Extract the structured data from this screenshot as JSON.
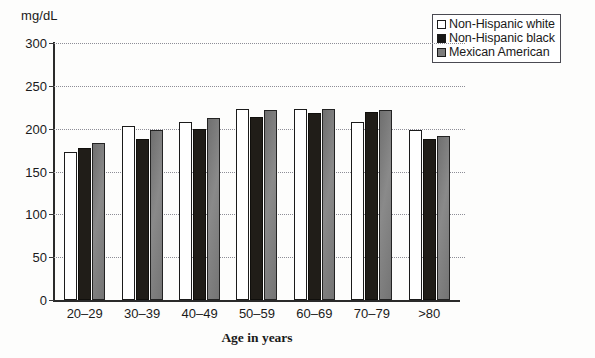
{
  "chart_data": {
    "type": "bar",
    "title": "",
    "subtitle": "",
    "unit_label": "mg/dL",
    "xlabel": "Age in years",
    "ylabel": "",
    "categories": [
      "20–29",
      "30–39",
      "40–49",
      "50–59",
      "60–69",
      "70–79",
      ">80"
    ],
    "series": [
      {
        "name": "Non-Hispanic white",
        "color": "#ffffff",
        "values": [
          173,
          203,
          208,
          223,
          223,
          208,
          198
        ]
      },
      {
        "name": "Non-Hispanic black",
        "color": "#201d18",
        "values": [
          178,
          188,
          200,
          214,
          218,
          220,
          188
        ]
      },
      {
        "name": "Mexican American",
        "color": "#7b7b7b",
        "values": [
          183,
          198,
          213,
          222,
          223,
          222,
          192
        ]
      }
    ],
    "ylim": [
      0,
      300
    ],
    "yticks": [
      0,
      50,
      100,
      150,
      200,
      250,
      300
    ],
    "ytick_labels": [
      "0",
      "50",
      "100",
      "150",
      "200",
      "250",
      "300"
    ],
    "grid": true,
    "grid_style": "dotted-horizontal",
    "legend_position": "top-right",
    "legend_border": true,
    "annotations": []
  },
  "legend": {
    "items": [
      {
        "label": "Non-Hispanic white",
        "swatch": "white-square-icon"
      },
      {
        "label": "Non-Hispanic black",
        "swatch": "black-square-icon"
      },
      {
        "label": "Mexican American",
        "swatch": "gray-square-icon"
      }
    ]
  },
  "colors": {
    "series_white": "#ffffff",
    "series_black": "#201d18",
    "series_gray": "#7b7b7b",
    "axis": "#2a2a2a",
    "gridline": "#8d8d96",
    "text": "#1a1a1a",
    "page_background": "#fdfdfc"
  }
}
